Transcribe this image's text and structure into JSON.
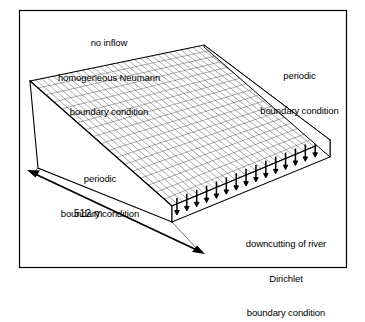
{
  "figure": {
    "frame": {
      "color": "#000000"
    },
    "background": "#ffffff",
    "line_color": "#000000",
    "mesh_color": "#333333"
  },
  "labels": {
    "top_left": {
      "name": "no-inflow-neumann-label",
      "lines": [
        "no inflow",
        "homogeneous Neumann",
        "boundary condition"
      ]
    },
    "right": {
      "name": "periodic-boundary-right-label",
      "lines": [
        "periodic",
        "boundary condition"
      ]
    },
    "left": {
      "name": "periodic-boundary-left-label",
      "lines": [
        "periodic",
        "boundary condition"
      ]
    },
    "dimension": {
      "name": "domain-length-label",
      "value": "512 m"
    },
    "bottom_right": {
      "name": "downcutting-dirichlet-label",
      "lines": [
        "downcutting of river",
        "Dirichlet",
        "boundary condition"
      ]
    }
  },
  "diagram": {
    "type": "3d-block-mesh",
    "mesh": {
      "columns": 30,
      "rows": 18
    },
    "downcutting_arrows": {
      "count": 16,
      "direction": "down"
    },
    "dimension_arrow": {
      "style": "double-headed",
      "label": "512 m"
    }
  }
}
